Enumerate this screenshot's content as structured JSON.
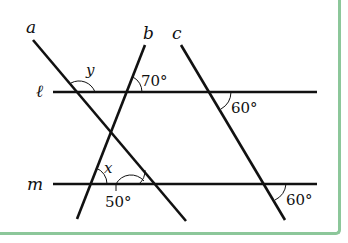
{
  "figure": {
    "type": "geometry-diagram",
    "border_color": "#8cc79a",
    "line_color": "#111111"
  },
  "lines": {
    "a": {
      "label": "a",
      "x1": 33,
      "y1": 40,
      "x2": 186,
      "y2": 221
    },
    "b": {
      "label": "b",
      "x1": 145,
      "y1": 45,
      "x2": 77,
      "y2": 219
    },
    "c": {
      "label": "c",
      "x1": 181,
      "y1": 45,
      "x2": 285,
      "y2": 220
    },
    "l": {
      "label": "ℓ",
      "y": 92,
      "x1": 53,
      "x2": 317
    },
    "m": {
      "label": "m",
      "y": 184,
      "x1": 53,
      "x2": 317
    }
  },
  "angles": {
    "y": {
      "label": "y"
    },
    "b_l": {
      "label": "70°"
    },
    "c_l": {
      "label": "60°"
    },
    "x": {
      "label": "x"
    },
    "a_m": {
      "label": "50°"
    },
    "c_m": {
      "label": "60°"
    }
  }
}
